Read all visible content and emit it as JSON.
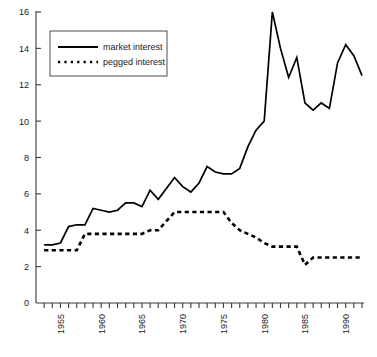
{
  "chart_data": {
    "type": "line",
    "title": "",
    "xlabel": "",
    "ylabel": "",
    "xlim": [
      1952,
      1992
    ],
    "ylim": [
      0,
      16
    ],
    "grid": false,
    "legend_position": "top-left",
    "y_ticks": [
      0,
      2,
      4,
      6,
      8,
      10,
      12,
      14,
      16
    ],
    "y_tick_labels": [
      "0",
      "2",
      "4",
      "6",
      "8",
      "10",
      "12",
      "14",
      "16"
    ],
    "x_ticks": [
      1953,
      1954,
      1955,
      1956,
      1957,
      1958,
      1959,
      1960,
      1961,
      1962,
      1963,
      1964,
      1965,
      1966,
      1967,
      1968,
      1969,
      1970,
      1971,
      1972,
      1973,
      1974,
      1975,
      1976,
      1977,
      1978,
      1979,
      1980,
      1981,
      1982,
      1983,
      1984,
      1985,
      1986,
      1987,
      1988,
      1989,
      1990,
      1991,
      1992
    ],
    "x_tick_labels": [
      "1955",
      "1960",
      "1965",
      "1970",
      "1975",
      "1980",
      "1985",
      "1990"
    ],
    "x_labeled_ticks": [
      1955,
      1960,
      1965,
      1970,
      1975,
      1980,
      1985,
      1990
    ],
    "x": [
      1953,
      1954,
      1955,
      1956,
      1957,
      1958,
      1959,
      1960,
      1961,
      1962,
      1963,
      1964,
      1965,
      1966,
      1967,
      1968,
      1969,
      1970,
      1971,
      1972,
      1973,
      1974,
      1975,
      1976,
      1977,
      1978,
      1979,
      1980,
      1981,
      1982,
      1983,
      1984,
      1985,
      1986,
      1987,
      1988,
      1989,
      1990,
      1991,
      1992
    ],
    "series": [
      {
        "name": "market interest",
        "style": "solid",
        "color": "#000000",
        "values": [
          3.2,
          3.2,
          3.3,
          4.2,
          4.3,
          4.3,
          5.2,
          5.1,
          5.0,
          5.1,
          5.5,
          5.5,
          5.3,
          6.2,
          5.7,
          6.3,
          6.9,
          6.4,
          6.1,
          6.6,
          7.5,
          7.2,
          7.1,
          7.1,
          7.4,
          8.6,
          9.5,
          10.0,
          16.0,
          14.0,
          12.4,
          13.5,
          11.0,
          10.6,
          11.0,
          10.7,
          13.2,
          14.2,
          13.6,
          12.5
        ]
      },
      {
        "name": "pegged interest",
        "style": "dotted",
        "color": "#000000",
        "values": [
          2.9,
          2.9,
          2.9,
          2.9,
          2.9,
          3.8,
          3.8,
          3.8,
          3.8,
          3.8,
          3.8,
          3.8,
          3.8,
          4.0,
          4.0,
          4.5,
          5.0,
          5.0,
          5.0,
          5.0,
          5.0,
          5.0,
          5.0,
          4.4,
          4.0,
          3.8,
          3.6,
          3.3,
          3.1,
          3.1,
          3.1,
          3.1,
          2.1,
          2.5,
          2.5,
          2.5,
          2.5,
          2.5,
          2.5,
          2.5
        ]
      }
    ]
  },
  "legend": {
    "entries": [
      {
        "label": "market interest",
        "style": "solid"
      },
      {
        "label": "pegged interest",
        "style": "dotted"
      }
    ]
  },
  "colors": {
    "axis": "#3a3a3a",
    "series": "#000000",
    "background": "#ffffff"
  }
}
